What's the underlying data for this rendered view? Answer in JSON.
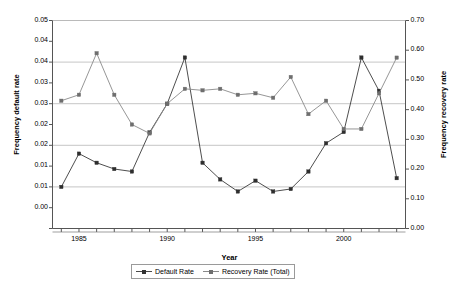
{
  "chart_data": {
    "type": "line",
    "title": "",
    "xlabel": "Year",
    "ylabel": "Frequency default rate",
    "ylabel_right": "Frequency recovery rate",
    "grid": true,
    "legend_position": "bottom",
    "x": [
      1984,
      1985,
      1986,
      1987,
      1988,
      1989,
      1990,
      1991,
      1992,
      1993,
      1994,
      1995,
      1996,
      1997,
      1998,
      1999,
      2000,
      2001,
      2002,
      2003
    ],
    "xlim": [
      1983.5,
      2003.5
    ],
    "xticks_major": [
      "1985",
      "1990",
      "1995",
      "2000"
    ],
    "xticks_major_values": [
      1985,
      1990,
      1995,
      2000
    ],
    "xtick_step": 1,
    "ylim": [
      0,
      0.05
    ],
    "yticks": [
      0.0,
      0.005,
      0.01,
      0.015,
      0.02,
      0.025,
      0.03,
      0.035,
      0.04,
      0.045,
      0.05
    ],
    "yticklabels": [
      "0.00",
      "0.01",
      "0.01",
      "0.02",
      "0.02",
      "0.03",
      "0.03",
      "0.04",
      "0.04",
      "0.05"
    ],
    "yticklabels_shown": [
      "0.05",
      "0.04",
      "0.04",
      "0.03",
      "0.03",
      "0.02",
      "0.02",
      "0.01",
      "0.01",
      "0.00"
    ],
    "ylim_right": [
      0,
      0.7
    ],
    "yticks_right": [
      0.0,
      0.1,
      0.2,
      0.3,
      0.4,
      0.5,
      0.6,
      0.7
    ],
    "yticklabels_right": [
      "0.70",
      "0.60",
      "0.50",
      "0.40",
      "0.30",
      "0.20",
      "0.10",
      "0.00"
    ],
    "gridlines_left": [
      0.0,
      0.01,
      0.02,
      0.03,
      0.04,
      0.05
    ],
    "series": [
      {
        "name": "Default Rate",
        "axis": "left",
        "color": "#3a3a3a",
        "marker": "square",
        "values": [
          0.01,
          0.018,
          0.0158,
          0.0143,
          0.0137,
          0.0231,
          0.03,
          0.0411,
          0.0158,
          0.0118,
          0.0089,
          0.0115,
          0.0089,
          0.0095,
          0.0137,
          0.0205,
          0.0232,
          0.0411,
          0.0331,
          0.0121
        ]
      },
      {
        "name": "Recovery Rate (Total)",
        "axis": "right",
        "color": "#8a8a8a",
        "marker": "square",
        "values": [
          0.43,
          0.45,
          0.59,
          0.45,
          0.35,
          0.32,
          0.42,
          0.47,
          0.465,
          0.47,
          0.45,
          0.455,
          0.44,
          0.51,
          0.385,
          0.43,
          0.335,
          0.335,
          0.455,
          0.575
        ]
      }
    ]
  },
  "legend": {
    "items": [
      {
        "label": "Default Rate"
      },
      {
        "label": "Recovery Rate (Total)"
      }
    ]
  },
  "axes": {
    "left_title": "Frequency default rate",
    "right_title": "Frequency recovery rate",
    "x_title": "Year"
  }
}
